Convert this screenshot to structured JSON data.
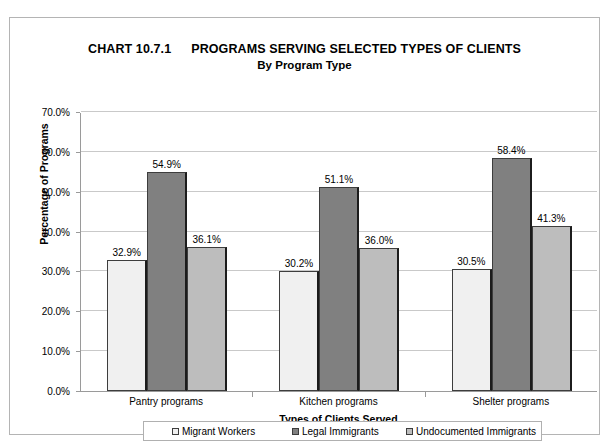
{
  "chart_data": {
    "type": "bar",
    "title_chart_number": "CHART 10.7.1",
    "title_main": "PROGRAMS SERVING SELECTED TYPES OF CLIENTS",
    "subtitle": "By Program Type",
    "xlabel": "Types of Clients Served",
    "ylabel": "Percentage of Programs",
    "categories": [
      "Pantry programs",
      "Kitchen programs",
      "Shelter programs"
    ],
    "series": [
      {
        "name": "Migrant Workers",
        "color": "#f0f0f0",
        "values": [
          32.9,
          30.2,
          30.5
        ],
        "labels": [
          "32.9%",
          "30.2%",
          "30.5%"
        ]
      },
      {
        "name": "Legal Immigrants",
        "color": "#808080",
        "values": [
          54.9,
          51.1,
          58.4
        ],
        "labels": [
          "54.9%",
          "51.1%",
          "58.4%"
        ]
      },
      {
        "name": "Undocumented Immigrants",
        "color": "#bdbdbd",
        "values": [
          36.1,
          36.0,
          41.3
        ],
        "labels": [
          "36.1%",
          "36.0%",
          "41.3%"
        ]
      }
    ],
    "ylim": [
      0,
      70
    ],
    "ytick_values": [
      0,
      10,
      20,
      30,
      40,
      50,
      60,
      70
    ],
    "ytick_labels": [
      "0.0%",
      "10.0%",
      "20.0%",
      "30.0%",
      "40.0%",
      "50.0%",
      "60.0%",
      "70.0%"
    ],
    "grid": true,
    "legend_position": "bottom",
    "legend_entries": [
      "Migrant Workers",
      "Legal Immigrants",
      "Undocumented Immigrants"
    ]
  }
}
